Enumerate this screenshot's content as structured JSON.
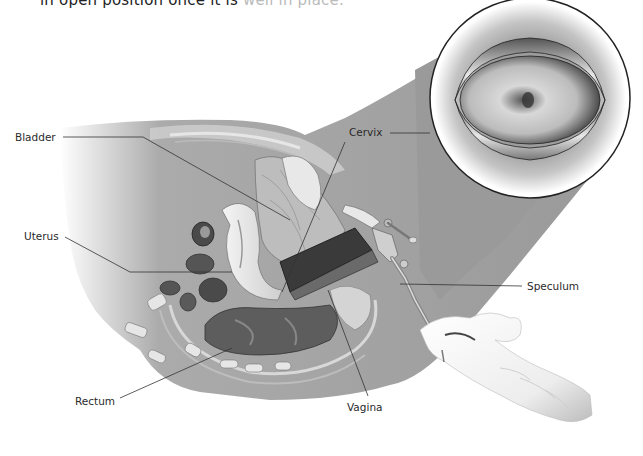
{
  "caption": {
    "text_dark": "in open position once it is ",
    "text_faded": "well in place."
  },
  "diagram": {
    "labels": [
      {
        "id": "bladder",
        "text": "Bladder"
      },
      {
        "id": "uterus",
        "text": "Uterus"
      },
      {
        "id": "cervix",
        "text": "Cervix"
      },
      {
        "id": "speculum",
        "text": "Speculum"
      },
      {
        "id": "rectum",
        "text": "Rectum"
      },
      {
        "id": "vagina",
        "text": "Vagina"
      }
    ],
    "inset": {
      "description": "Cervix viewed through open speculum"
    },
    "colors": {
      "body_gray": "#9a9a9a",
      "line": "#333333",
      "glove": "#f2f2f2"
    }
  }
}
